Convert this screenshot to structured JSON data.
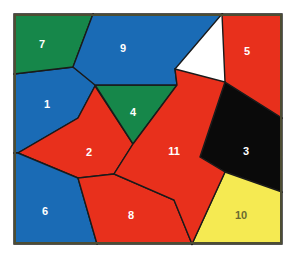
{
  "figure": {
    "width": 296,
    "height": 261,
    "background_color": "#ffffff",
    "border_color": "#4d4d33",
    "border_width": 2,
    "edge_color": "#1a1a1a",
    "edge_width": 1.4,
    "plot_area": {
      "x": 14,
      "y": 14,
      "width": 268,
      "height": 230
    }
  },
  "palette": {
    "blue": "#1a6bb5",
    "green": "#16874a",
    "red": "#e8301c",
    "yellow": "#f5ea52",
    "black": "#0a0a0a",
    "label_light": "#ffffff",
    "label_dark": "#6b6b30"
  },
  "chart_data": {
    "type": "map",
    "region_count": 11,
    "color_count": 5,
    "colors_used": [
      "blue",
      "green",
      "red",
      "yellow",
      "black"
    ],
    "regions": [
      {
        "id": 1,
        "label": "1",
        "color_name": "blue",
        "color": "#1a6bb5",
        "label_color": "#ffffff",
        "label_x": 47,
        "label_y": 105,
        "points": "14,74 73,67 97,85 95,86 78,118 18,153 14,153"
      },
      {
        "id": 2,
        "label": "2",
        "color_name": "red",
        "color": "#e8301c",
        "label_color": "#ffffff",
        "label_x": 89,
        "label_y": 153,
        "points": "95,86 133,144 114,174 78,178 18,153 78,118"
      },
      {
        "id": 3,
        "label": "3",
        "color_name": "black",
        "color": "#0a0a0a",
        "label_color": "#ffffff",
        "label_x": 246,
        "label_y": 152,
        "points": "225,82 282,118 282,192 225,172 200,157"
      },
      {
        "id": 4,
        "label": "4",
        "color_name": "green",
        "color": "#16874a",
        "label_color": "#ffffff",
        "label_x": 133,
        "label_y": 113,
        "points": "95,85 177,85 133,144"
      },
      {
        "id": 5,
        "label": "5",
        "color_name": "red",
        "color": "#e8301c",
        "label_color": "#ffffff",
        "label_x": 247,
        "label_y": 52,
        "points": "222,14 282,14 282,118 225,82"
      },
      {
        "id": 6,
        "label": "6",
        "color_name": "blue",
        "color": "#1a6bb5",
        "label_color": "#ffffff",
        "label_x": 45,
        "label_y": 212,
        "points": "14,153 18,153 78,178 97,244 14,244"
      },
      {
        "id": 7,
        "label": "7",
        "color_name": "green",
        "color": "#16874a",
        "label_color": "#ffffff",
        "label_x": 42,
        "label_y": 45,
        "points": "14,14 93,14 73,67 14,74"
      },
      {
        "id": 8,
        "label": "8",
        "color_name": "red",
        "color": "#e8301c",
        "label_color": "#ffffff",
        "label_x": 131,
        "label_y": 216,
        "points": "114,174 174,200 192,244 97,244 78,178"
      },
      {
        "id": 9,
        "label": "9",
        "color_name": "blue",
        "color": "#1a6bb5",
        "label_color": "#ffffff",
        "label_x": 123,
        "label_y": 49,
        "points": "93,14 222,14 175,69 177,85 95,85 73,67"
      },
      {
        "id": 10,
        "label": "10",
        "color_name": "yellow",
        "color": "#f5ea52",
        "label_color": "#6b6b30",
        "label_x": 241,
        "label_y": 216,
        "points": "225,172 282,192 282,244 192,244"
      },
      {
        "id": 11,
        "label": "11",
        "color_name": "red",
        "color": "#e8301c",
        "label_color": "#ffffff",
        "label_x": 174,
        "label_y": 152,
        "points": "177,85 175,69 225,82 200,157 225,172 192,244 174,200 114,174 133,144"
      }
    ]
  }
}
